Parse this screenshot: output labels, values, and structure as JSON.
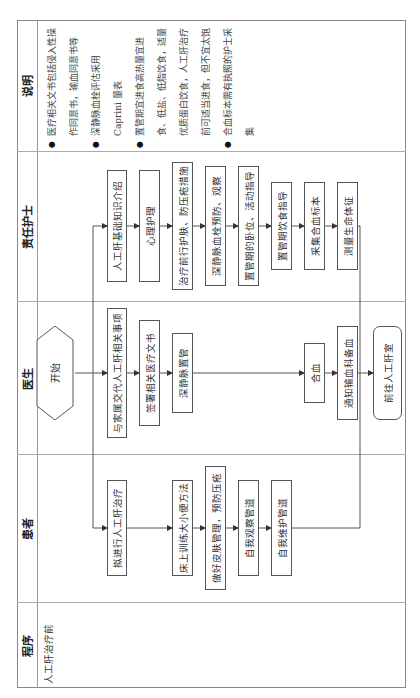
{
  "table": {
    "headers": {
      "procedure": "程序",
      "patient": "患者",
      "doctor": "医生",
      "nurse": "责任护士",
      "notes": "说明"
    },
    "stage": "人工肝治疗前"
  },
  "flow": {
    "start": "开始",
    "end": "前往人工肝室",
    "nurse_steps": [
      "人工肝基础知识介绍",
      "心理护理",
      "治疗前行护肤、防压疮措施",
      "深静脉血栓预防、观察",
      "置管期的卧位、活动指导",
      "置管期饮食指导",
      "采集合血标本",
      "测量生命体征"
    ],
    "doctor_steps": [
      "与家属交代人工肝相关事项",
      "签署相关医疗文书",
      "深静脉置管",
      "合血",
      "通知输血科备血"
    ],
    "patient_steps": [
      "拟进行人工肝治疗",
      "床上训练大小便方法",
      "做好皮肤管理，预防压疮",
      "自我观察管道",
      "自我维护管道"
    ]
  },
  "notes": [
    "医疗相关文书包括侵入性操作同意书，输血同意书等",
    "深静脉血栓评估采用 Caprini 量表",
    "置管期宜进食高热量宜进食、低盐、低脂饮食，适量优质蛋白饮食，人工肝治疗前可适当进食，但不宜太饱",
    "合血标本需有执照的护士采集"
  ],
  "colors": {
    "line": "#555555",
    "grid": "#999999",
    "text": "#333333"
  }
}
